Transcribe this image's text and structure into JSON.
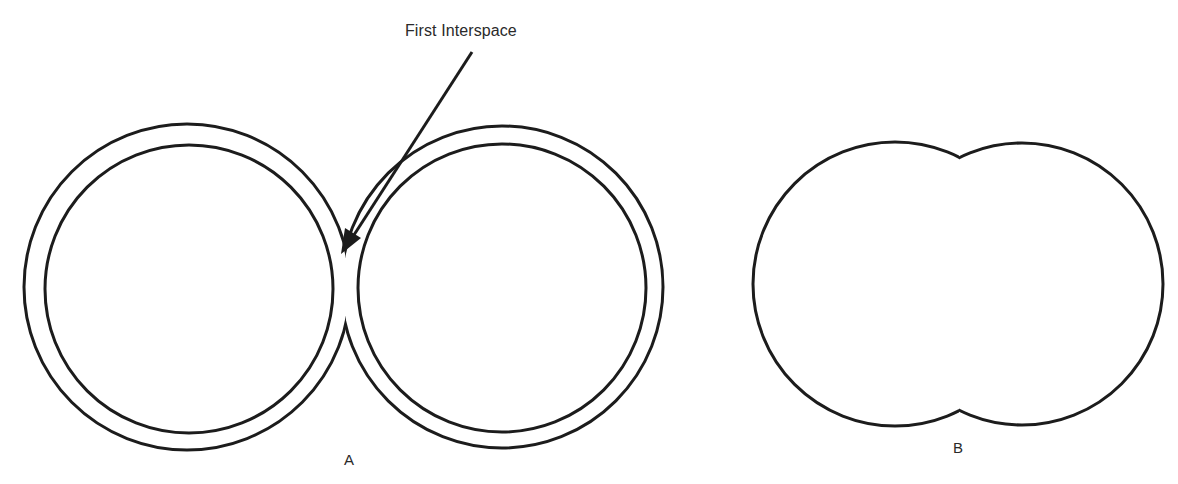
{
  "figure": {
    "annotation": "First Interspace",
    "panels": [
      {
        "id": "A",
        "label": "A",
        "description": "Two adjacent double-walled rings with an interspace between them"
      },
      {
        "id": "B",
        "label": "B",
        "description": "Two merged circles forming a single outline"
      }
    ]
  },
  "colors": {
    "stroke": "#1c1c1c",
    "background": "#ffffff",
    "text": "#2a2a2a"
  }
}
